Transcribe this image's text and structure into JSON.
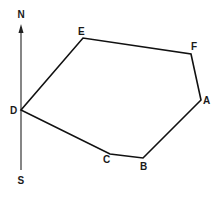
{
  "diagram": {
    "type": "polygon-with-north-south-line",
    "compass": {
      "north_label": "N",
      "south_label": "S",
      "x": 21,
      "y_top": 25,
      "y_bottom": 170
    },
    "vertices": [
      {
        "id": "A",
        "label": "A",
        "x": 201,
        "y": 100
      },
      {
        "id": "B",
        "label": "B",
        "x": 143,
        "y": 158
      },
      {
        "id": "C",
        "label": "C",
        "x": 110,
        "y": 154
      },
      {
        "id": "D",
        "label": "D",
        "x": 21,
        "y": 110
      },
      {
        "id": "E",
        "label": "E",
        "x": 83,
        "y": 38
      },
      {
        "id": "F",
        "label": "F",
        "x": 191,
        "y": 54
      }
    ],
    "edges": [
      "A-B",
      "B-C",
      "C-D",
      "D-E",
      "E-F",
      "F-A"
    ],
    "colors": {
      "line": "#111111",
      "background": "#ffffff"
    }
  }
}
